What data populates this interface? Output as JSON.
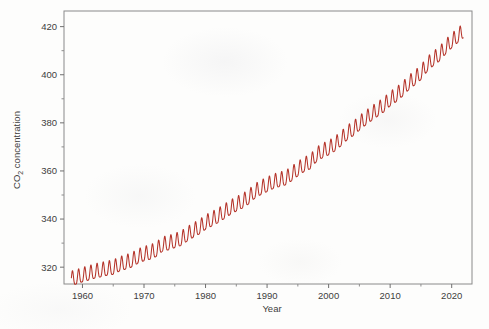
{
  "chart_data": {
    "type": "line",
    "title": "",
    "xlabel": "Year",
    "ylabel": "CO2 concentration",
    "ylabel_display": "CO",
    "ylabel_sub": "2",
    "ylabel_tail": " concentration",
    "xlim": [
      1957.0,
      2023.3
    ],
    "ylim": [
      313.0,
      426.5
    ],
    "xticks": [
      1960,
      1970,
      1980,
      1990,
      2000,
      2010,
      2020
    ],
    "xtick_labels": [
      "1960",
      "1970",
      "1980",
      "1990",
      "2000",
      "2010",
      "2020"
    ],
    "xminor_ticks": [
      1965,
      1975,
      1985,
      1995,
      2005,
      2015
    ],
    "yticks": [
      320,
      340,
      360,
      380,
      400,
      420
    ],
    "ytick_labels": [
      "320",
      "340",
      "360",
      "380",
      "400",
      "420"
    ],
    "yminor_ticks": [
      330,
      350,
      370,
      390,
      410
    ],
    "grid": false,
    "legend": null,
    "line_color": "#b5342a",
    "axis_color": "#8a8a8a",
    "text_color": "#3d3d3d",
    "background": "#fdfdfc",
    "series": [
      {
        "name": "Mauna Loa monthly mean CO2",
        "seasonal_amplitude_ppm": 3.0,
        "seasonal_peak_month": 5,
        "annual_means": {
          "1958": 315.3,
          "1959": 315.98,
          "1960": 316.91,
          "1961": 317.64,
          "1962": 318.45,
          "1963": 318.99,
          "1964": 319.62,
          "1965": 320.04,
          "1966": 321.37,
          "1967": 322.18,
          "1968": 323.05,
          "1969": 324.62,
          "1970": 325.68,
          "1971": 326.32,
          "1972": 327.46,
          "1973": 329.68,
          "1974": 330.19,
          "1975": 331.12,
          "1976": 332.03,
          "1977": 333.84,
          "1978": 335.41,
          "1979": 336.84,
          "1980": 338.76,
          "1981": 340.12,
          "1982": 341.48,
          "1983": 343.15,
          "1984": 344.87,
          "1985": 346.35,
          "1986": 347.61,
          "1987": 349.31,
          "1988": 351.69,
          "1989": 353.2,
          "1990": 354.45,
          "1991": 355.7,
          "1992": 356.54,
          "1993": 357.21,
          "1994": 358.96,
          "1995": 360.97,
          "1996": 362.74,
          "1997": 363.88,
          "1998": 366.84,
          "1999": 368.54,
          "2000": 369.71,
          "2001": 371.32,
          "2002": 373.45,
          "2003": 375.98,
          "2004": 377.7,
          "2005": 379.98,
          "2006": 382.09,
          "2007": 384.02,
          "2008": 385.83,
          "2009": 387.64,
          "2010": 390.1,
          "2011": 391.85,
          "2012": 394.06,
          "2013": 396.74,
          "2014": 398.81,
          "2015": 401.01,
          "2016": 404.41,
          "2017": 406.76,
          "2018": 408.72,
          "2019": 411.66,
          "2020": 414.24,
          "2021": 416.45
        },
        "start_year": 1958.2,
        "end_year": 2021.9,
        "start_value_ppm": 315.3,
        "end_value_ppm": 417.0
      }
    ]
  },
  "figure": {
    "plot_box": {
      "left": 64,
      "top": 11,
      "right": 472,
      "bottom": 284
    }
  }
}
